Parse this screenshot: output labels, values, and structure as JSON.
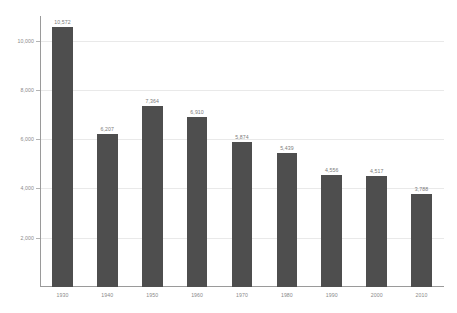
{
  "chart_data": {
    "type": "bar",
    "title": "",
    "subtitle": "",
    "xlabel": "",
    "ylabel": "",
    "categories": [
      "1930",
      "1940",
      "1950",
      "1960",
      "1970",
      "1980",
      "1990",
      "2000",
      "2010"
    ],
    "values": [
      10572,
      6207,
      7364,
      6910,
      5874,
      5439,
      4556,
      4517,
      3788
    ],
    "value_labels": [
      "10,572",
      "6,207",
      "7,364",
      "6,910",
      "5,874",
      "5,439",
      "4,556",
      "4,517",
      "3,788"
    ],
    "ylim": [
      0,
      11000
    ],
    "y_ticks": [
      2000,
      4000,
      6000,
      8000,
      10000
    ],
    "y_tick_labels": [
      "2,000",
      "4,000",
      "6,000",
      "8,000",
      "10,000"
    ],
    "grid": true,
    "legend": null,
    "legend_position": "none",
    "bar_color": "#4e4e4e",
    "axis_color": "#9a9a9a",
    "grid_color": "#e9e9e9",
    "label_color": "#8a8a8a",
    "value_label_color": "#7c7c7c",
    "background_color": "#ffffff"
  }
}
